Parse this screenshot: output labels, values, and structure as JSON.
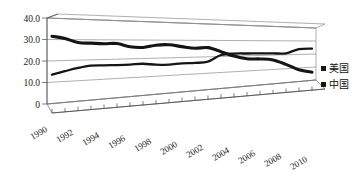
{
  "chart_data": {
    "type": "line",
    "title": "",
    "subtitle": "",
    "xlabel": "",
    "ylabel": "",
    "ylim": [
      0,
      40
    ],
    "xlim": [
      1990,
      2011
    ],
    "grid": true,
    "three_d": true,
    "legend_position": "right",
    "y_ticks": [
      "0",
      "10.0",
      "20.0",
      "30.0",
      "40.0"
    ],
    "y_tick_values": [
      0,
      10,
      20,
      30,
      40
    ],
    "x_tick_labels": [
      "1990",
      "1992",
      "1994",
      "1996",
      "1998",
      "2000",
      "2002",
      "2004",
      "2006",
      "2008",
      "2010"
    ],
    "x": [
      1990,
      1991,
      1992,
      1993,
      1994,
      1995,
      1996,
      1997,
      1998,
      1999,
      2000,
      2001,
      2002,
      2003,
      2004,
      2005,
      2006,
      2007,
      2008,
      2009,
      2010
    ],
    "series": [
      {
        "name": "美国",
        "color": "#151515",
        "values": [
          31.5,
          30.5,
          28.6,
          28.3,
          28.0,
          28.1,
          26.4,
          26.0,
          27.2,
          27.4,
          26.3,
          25.3,
          25.6,
          23.0,
          20.0,
          18.0,
          17.6,
          16.6,
          13.0,
          8.5,
          6.0
        ]
      },
      {
        "name": "中国",
        "color": "#151515",
        "values": [
          13.6,
          15.0,
          16.3,
          17.2,
          17.1,
          17.0,
          17.0,
          17.2,
          16.4,
          16.2,
          16.6,
          16.6,
          17.0,
          20.9,
          21.6,
          21.5,
          21.4,
          21.2,
          21.0,
          23.9,
          24.2
        ]
      }
    ]
  },
  "legend": {
    "items": [
      {
        "label": "美国",
        "marker": "square-marker",
        "color": "#151515"
      },
      {
        "label": "中国",
        "marker": "square-marker",
        "color": "#151515"
      }
    ]
  },
  "axes": {
    "y_axis_name": "value-axis",
    "x_axis_name": "year-axis"
  }
}
